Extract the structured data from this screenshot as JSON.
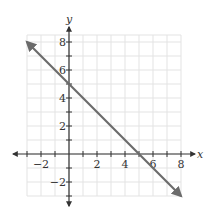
{
  "chart_data": {
    "type": "line",
    "title": "",
    "xlabel": "x",
    "ylabel": "y",
    "xlim": [
      -3,
      8
    ],
    "ylim": [
      -3,
      8.5
    ],
    "grid": true,
    "legend": null,
    "x_ticks": [
      -2,
      2,
      4,
      6,
      8
    ],
    "y_ticks": [
      -2,
      2,
      4,
      6,
      8
    ],
    "x_tick_labels": [
      "−2",
      "2",
      "4",
      "6",
      "8"
    ],
    "y_tick_labels": [
      "−2",
      "2",
      "4",
      "6",
      "8"
    ],
    "series": [
      {
        "name": "line",
        "equation": "y = -x + 5",
        "x": [
          -3,
          8
        ],
        "y": [
          8,
          -3
        ],
        "arrows_both_ends": true
      }
    ],
    "annotations": []
  },
  "style": {
    "line_color": "#6b6b6b",
    "axis_color": "#333333",
    "grid_color": "#e3e3e3"
  }
}
